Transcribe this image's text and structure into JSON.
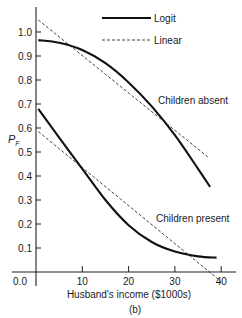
{
  "chart_data": {
    "type": "line",
    "title": "",
    "caption": "(b)",
    "xlabel": "Husband's income ($1000s)",
    "ylabel": "P_F",
    "xlim": [
      0,
      40
    ],
    "ylim": [
      0,
      1.08
    ],
    "x_ticks": [
      0,
      10,
      20,
      30,
      40
    ],
    "x_tick_labels": [
      "0.0",
      "10",
      "20",
      "30",
      "40"
    ],
    "y_ticks": [
      0.1,
      0.2,
      0.3,
      0.4,
      0.5,
      0.6,
      0.7,
      0.8,
      0.9,
      1.0
    ],
    "y_tick_labels": [
      "0.1",
      "0.2",
      "0.3",
      "0.4",
      "0.5",
      "0.6",
      "0.7",
      "0.8",
      "0.9",
      "1.0"
    ],
    "grid": false,
    "legend": {
      "position": "top-right",
      "entries": [
        {
          "label": "Logit",
          "style": "solid"
        },
        {
          "label": "Linear",
          "style": "dashed"
        }
      ]
    },
    "annotations": [
      {
        "text": "Children absent",
        "x": 29.5,
        "y": 0.7
      },
      {
        "text": "Children present",
        "x": 28.5,
        "y": 0.27
      }
    ],
    "series": [
      {
        "name": "Logit - Children absent",
        "style": "solid",
        "x": [
          0.5,
          5,
          10,
          15,
          20,
          25,
          30,
          35,
          37.6
        ],
        "y": [
          0.966,
          0.955,
          0.925,
          0.87,
          0.79,
          0.69,
          0.57,
          0.43,
          0.355
        ]
      },
      {
        "name": "Linear - Children absent",
        "style": "dashed",
        "x": [
          0.5,
          37.4
        ],
        "y": [
          1.05,
          0.475
        ]
      },
      {
        "name": "Logit - Children present",
        "style": "solid",
        "x": [
          0.5,
          5,
          10,
          15,
          20,
          25,
          30,
          35,
          39
        ],
        "y": [
          0.68,
          0.56,
          0.43,
          0.3,
          0.195,
          0.125,
          0.085,
          0.065,
          0.06
        ]
      },
      {
        "name": "Linear - Children present",
        "style": "dashed",
        "x": [
          0.5,
          40
        ],
        "y": [
          0.585,
          -0.04
        ]
      }
    ]
  }
}
